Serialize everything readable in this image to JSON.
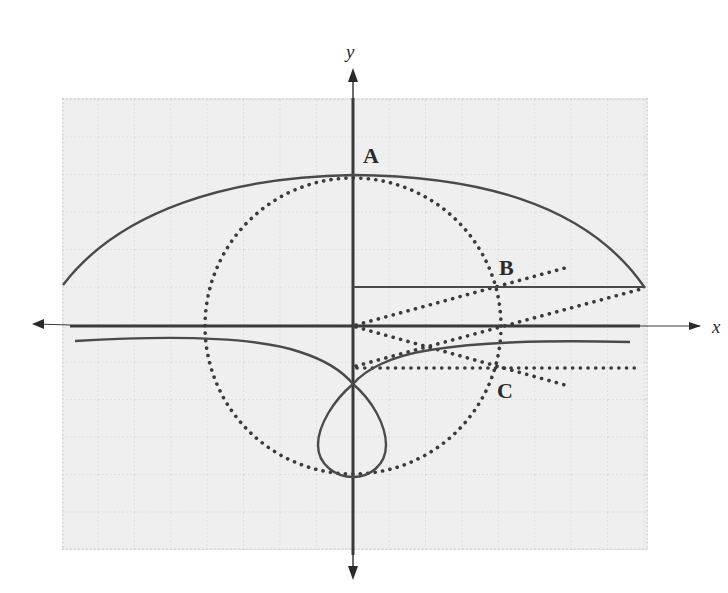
{
  "figure": {
    "type": "geometric-construction",
    "axes": {
      "x_label": "x",
      "y_label": "y"
    },
    "points": [
      {
        "label": "A",
        "x": 0,
        "y": 4.1
      },
      {
        "label": "B",
        "x": 3.9,
        "y": 1.05
      },
      {
        "label": "C",
        "x": 3.9,
        "y": -1.15
      }
    ],
    "colors": {
      "grid_background": "#efefef",
      "grid_line": "#c4c4c4",
      "curve": "#4a4a4a",
      "axis": "#3a3a3a",
      "dots": "#3a3a3a"
    },
    "grid": {
      "cell_px": 36.5,
      "range_x": [
        -8,
        8
      ],
      "range_y": [
        -6,
        6.2
      ]
    },
    "elements": {
      "circle_radius_units": 4,
      "horizontal_segment_y": 1.05,
      "dotted_horizontal_y": -1.15
    }
  }
}
